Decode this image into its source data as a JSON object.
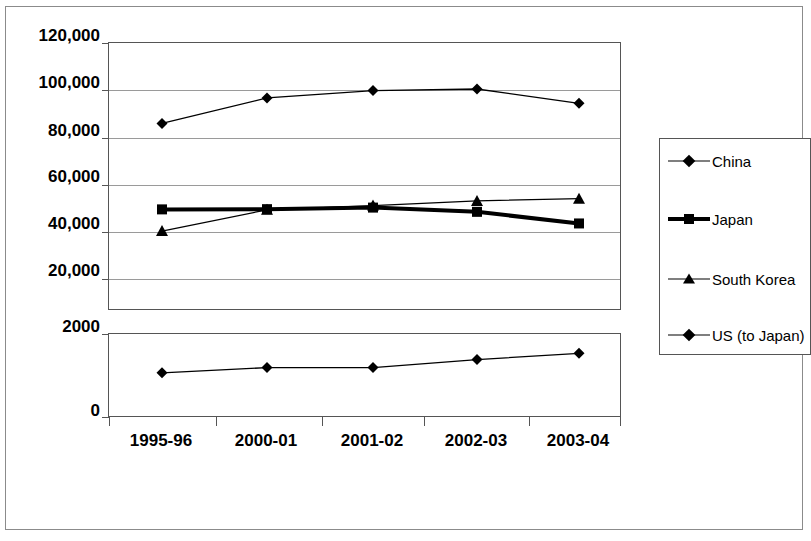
{
  "chart_data": {
    "type": "line",
    "title": "",
    "xlabel": "",
    "ylabel": "",
    "grid": true,
    "legend_position": "right",
    "broken_axis": true,
    "categories": [
      "1995-96",
      "2000-01",
      "2001-02",
      "2002-03",
      "2003-04"
    ],
    "upper_panel": {
      "ylim": [
        0,
        120000
      ],
      "yticks": [
        0,
        20000,
        40000,
        60000,
        80000,
        100000,
        120000
      ],
      "ytick_labels": [
        "",
        "20,000",
        "40,000",
        "60,000",
        "80,000",
        "100,000",
        "120,000"
      ],
      "series": [
        {
          "name": "China",
          "marker": "diamond",
          "line": "thin",
          "values": [
            84000,
            95400,
            98700,
            99400,
            93000
          ]
        },
        {
          "name": "Japan",
          "marker": "square",
          "line": "thick",
          "values": [
            45500,
            45600,
            46300,
            44400,
            39200
          ]
        },
        {
          "name": "South Korea",
          "marker": "triangle",
          "line": "thin",
          "values": [
            35800,
            45300,
            47200,
            49300,
            50300
          ]
        }
      ]
    },
    "lower_panel": {
      "ylim": [
        0,
        2000
      ],
      "yticks": [
        0,
        2000
      ],
      "ytick_labels": [
        "0",
        "2000"
      ],
      "series": [
        {
          "name": "US (to Japan)",
          "marker": "diamond",
          "line": "thin",
          "values": [
            1075,
            1200,
            1200,
            1390,
            1540
          ]
        }
      ]
    }
  },
  "legend": {
    "items": [
      {
        "label": "China",
        "marker": "diamond",
        "line": "thin"
      },
      {
        "label": "Japan",
        "marker": "square",
        "line": "thick"
      },
      {
        "label": "South Korea",
        "marker": "triangle",
        "line": "thin"
      },
      {
        "label": "US (to Japan)",
        "marker": "diamond",
        "line": "thin"
      }
    ]
  },
  "axis": {
    "upper_labels": [
      "120,000",
      "100,000",
      "80,000",
      "60,000",
      "40,000",
      "20,000"
    ],
    "lower_labels": [
      "2000",
      "0"
    ],
    "x_labels": [
      "1995-96",
      "2000-01",
      "2001-02",
      "2002-03",
      "2003-04"
    ]
  },
  "colors": {
    "line": "#000000",
    "grid": "#9a9a9a",
    "axis": "#555555",
    "frame": "#8b8b8b",
    "background": "#ffffff"
  }
}
